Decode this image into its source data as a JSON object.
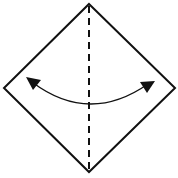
{
  "diagram": {
    "type": "origami-fold-step",
    "shape": "square rotated 45 degrees (diamond)",
    "fold_line": "valley fold (dashed vertical line)",
    "arrow": "curved double-headed arrow (fold and unfold)",
    "colors": {
      "background": "#ffffff",
      "stroke": "#111111"
    }
  }
}
